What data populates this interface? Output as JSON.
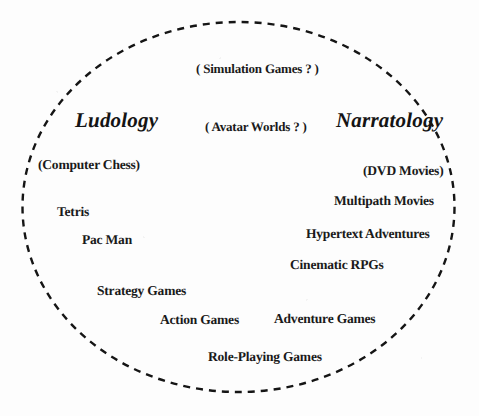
{
  "figure": {
    "shape": "dashed-ellipse",
    "ink_color": "#1a1a1a",
    "background_color": "#ffffff"
  },
  "poles": {
    "left": "Ludology",
    "right": "Narratology"
  },
  "center_questions": [
    "( Simulation Games ? )",
    "( Avatar Worlds ? )"
  ],
  "ludology_side": [
    "(Computer Chess)",
    "Tetris",
    "Pac Man",
    "Strategy Games",
    "Action Games"
  ],
  "narratology_side": [
    "(DVD Movies)",
    "Multipath Movies",
    "Hypertext Adventures",
    "Cinematic RPGs",
    "Adventure Games"
  ],
  "middle_items": [
    "Role-Playing Games"
  ],
  "labels": {
    "simulation_games": "( Simulation Games ? )",
    "avatar_worlds": "( Avatar Worlds ? )",
    "ludology": "Ludology",
    "narratology": "Narratology",
    "computer_chess": "(Computer Chess)",
    "dvd_movies": "(DVD Movies)",
    "tetris": "Tetris",
    "multipath_movies": "Multipath Movies",
    "pac_man": "Pac Man",
    "hypertext_adventures": "Hypertext Adventures",
    "cinematic_rpgs": "Cinematic RPGs",
    "strategy_games": "Strategy Games",
    "action_games": "Action Games",
    "adventure_games": "Adventure Games",
    "role_playing_games": "Role-Playing Games"
  }
}
